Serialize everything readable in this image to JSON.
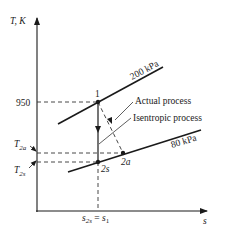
{
  "diagram": {
    "type": "T-s diagram",
    "axes": {
      "y_label": "T, K",
      "x_label": "s"
    },
    "y_ticks": {
      "t950": "950",
      "t2a_main": "T",
      "t2a_sub": "2a",
      "t2s_main": "T",
      "t2s_sub": "2s"
    },
    "x_ticks": {
      "s2s_main": "s",
      "s2s_sub": "2s",
      "eq": " = ",
      "s1_main": "s",
      "s1_sub": "1"
    },
    "isobars": [
      {
        "label": "200 kPa"
      },
      {
        "label": "80 kPa"
      }
    ],
    "states": {
      "s1": "1",
      "s2s": "2s",
      "s2a": "2a"
    },
    "annotations": {
      "actual": "Actual process",
      "isentropic": "Isentropic process"
    },
    "colors": {
      "line": "#1a1a1a",
      "dash": "#333333",
      "background": "#ffffff"
    }
  }
}
